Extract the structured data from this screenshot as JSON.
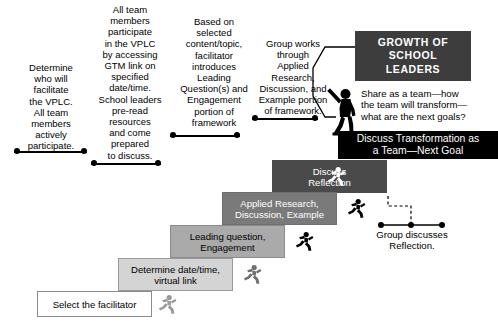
{
  "diagram": {
    "title_banner": "GROWTH OF\nSCHOOL\nLEADERS",
    "transform_banner": "Discuss Transformation as\na Team—Next Goal",
    "share_text": "Share as a team—how\nthe team will transform—\nwhat are the next goals?",
    "group_discusses_text": "Group discusses\nReflection.",
    "figure_name": "standing-person-figure"
  },
  "callouts": [
    {
      "id": "callout-facilitator",
      "text": "Determine\nwho will\nfacilitate\nthe VPLC.\nAll team\nmembers\nactively\nparticipate."
    },
    {
      "id": "callout-participate",
      "text": "All team\nmembers\nparticipate\nin the VPLC\nby accessing\nGTM link on\nspecified\ndate/time.\nSchool leaders\npre-read\nresources\nand come\nprepared\nto discuss."
    },
    {
      "id": "callout-leading-question",
      "text": "Based on\nselected\ncontent/topic,\nfacilitator\nintroduces\nLeading\nQuestion(s) and\nEngagement\nportion of\nframework"
    },
    {
      "id": "callout-applied-research",
      "text": "Group works\nthrough\nApplied\nResearch,\nDiscussion, and\nExample portion\nof framework."
    }
  ],
  "steps": [
    {
      "id": "step-select-facilitator",
      "label": "Select the facilitator",
      "color": "#ffffff"
    },
    {
      "id": "step-determine-datetime",
      "label": "Determine date/time,\nvirtual link",
      "color": "#d4d4d4"
    },
    {
      "id": "step-leading-question",
      "label": "Leading question,\nEngagement",
      "color": "#aaaaaa"
    },
    {
      "id": "step-applied-research",
      "label": "Applied Research,\nDiscussion, Example",
      "color": "#7a7a7a"
    },
    {
      "id": "step-discuss-reflection",
      "label": "Discuss\nReflection",
      "color": "#4a4a4a"
    }
  ],
  "colors": {
    "banner_dark": "#3d3d3d",
    "banner_black": "#000000",
    "step_white": "#ffffff",
    "step_light": "#d4d4d4",
    "step_mid": "#aaaaaa",
    "step_dark": "#7a7a7a",
    "step_darker": "#4a4a4a",
    "text_on_dark": "#ffffff",
    "text_on_light": "#000000",
    "line": "#000000"
  }
}
